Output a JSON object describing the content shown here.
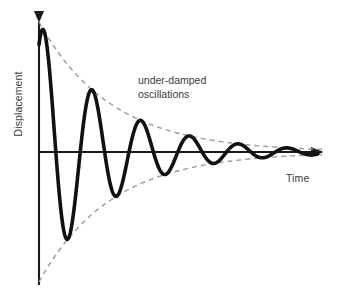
{
  "figure": {
    "background_color": "#ffffff",
    "curve_color": "#111111",
    "envelope_color": "#9a9a9a",
    "axis_color": "#1a1a1a",
    "text_color": "#3a3a3a"
  },
  "labels": {
    "y_axis": "Displacement",
    "x_axis": "Time",
    "annotation_line1": "under-damped",
    "annotation_line2": "oscillations"
  },
  "chart_data": {
    "type": "line",
    "title": "",
    "xlabel": "Time",
    "ylabel": "Displacement",
    "grid": false,
    "legend": "none",
    "annotations": [
      {
        "text": "under-damped oscillations",
        "x_px": 138,
        "y_px": 74
      }
    ],
    "axes": {
      "origin_px": {
        "x": 39,
        "y": 152
      },
      "x_axis_end_px": {
        "x": 327,
        "y": 152
      },
      "y_axis_top_px": {
        "x": 39,
        "y": 18
      },
      "y_axis_bottom_px": {
        "x": 39,
        "y": 285
      },
      "xlim": [
        0,
        6.2
      ],
      "ylim": [
        -1.05,
        1.05
      ],
      "ticks": []
    },
    "model": {
      "equation": "y = A * exp(-t/tau) * cos(2*pi*t/T)",
      "amplitude_A": 1.0,
      "decay_tau": 1.55,
      "period_T": 1.05,
      "cycles_visible": 5.5
    },
    "series": [
      {
        "name": "displacement",
        "style": "solid",
        "color": "#111111",
        "width_px": 3.6,
        "extrema_px": [
          {
            "kind": "peak",
            "x": 50,
            "y": 38
          },
          {
            "kind": "trough",
            "x": 72,
            "y": 240
          },
          {
            "kind": "peak",
            "x": 100,
            "y": 87
          },
          {
            "kind": "trough",
            "x": 128,
            "y": 198
          },
          {
            "kind": "peak",
            "x": 152,
            "y": 118
          },
          {
            "kind": "trough",
            "x": 178,
            "y": 180
          },
          {
            "kind": "peak",
            "x": 207,
            "y": 131
          },
          {
            "kind": "trough",
            "x": 228,
            "y": 172
          },
          {
            "kind": "peak",
            "x": 256,
            "y": 140
          },
          {
            "kind": "trough",
            "x": 275,
            "y": 166
          },
          {
            "kind": "peak",
            "x": 295,
            "y": 147
          }
        ]
      },
      {
        "name": "upper-envelope",
        "style": "dashed",
        "color": "#9a9a9a",
        "width_px": 1.4,
        "start_px": {
          "x": 40,
          "y": 22
        },
        "end_px": {
          "x": 320,
          "y": 147
        }
      },
      {
        "name": "lower-envelope",
        "style": "dashed",
        "color": "#9a9a9a",
        "width_px": 1.4,
        "start_px": {
          "x": 40,
          "y": 282
        },
        "end_px": {
          "x": 320,
          "y": 157
        }
      }
    ]
  }
}
